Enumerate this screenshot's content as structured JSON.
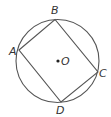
{
  "diagram": {
    "type": "inscribed-quadrilateral",
    "circle": {
      "center_label": "O",
      "cx": 57.5,
      "cy": 61,
      "r": 41.5
    },
    "vertices": [
      {
        "label": "A",
        "x": 19,
        "y": 50
      },
      {
        "label": "B",
        "x": 55,
        "y": 19.5
      },
      {
        "label": "C",
        "x": 98,
        "y": 72
      },
      {
        "label": "D",
        "x": 61,
        "y": 102
      }
    ],
    "labels": {
      "A": "A",
      "B": "B",
      "C": "C",
      "D": "D",
      "O": "O"
    },
    "stroke_color": "#555555"
  }
}
